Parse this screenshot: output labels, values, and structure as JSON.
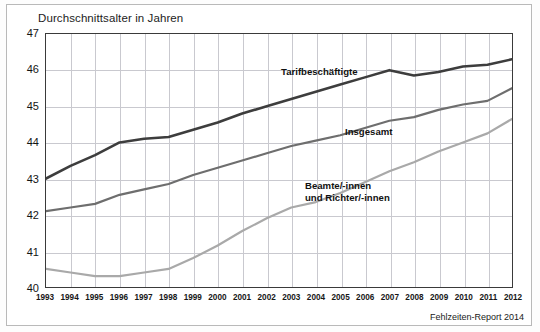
{
  "chart_data": {
    "type": "line",
    "title": "Durchschnittsalter in Jahren",
    "xlabel": "",
    "ylabel": "Durchschnittsalter in Jahren",
    "ylim": [
      40,
      47
    ],
    "yticks": [
      40,
      41,
      42,
      43,
      44,
      45,
      46,
      47
    ],
    "grid": true,
    "legend_position": "inline-annotations",
    "source": "Fehlzeiten-Report 2014",
    "categories": [
      "1993",
      "1994",
      "1995",
      "1996",
      "1997",
      "1998",
      "1999",
      "2000",
      "2001",
      "2002",
      "2003",
      "2004",
      "2005",
      "2006",
      "2007",
      "2008",
      "2009",
      "2010",
      "2011",
      "2012"
    ],
    "series": [
      {
        "name": "Tarifbeschäftigte",
        "color": "#3d3d3d",
        "values": [
          43.0,
          43.35,
          43.65,
          44.0,
          44.1,
          44.15,
          44.35,
          44.55,
          44.8,
          45.0,
          45.2,
          45.4,
          45.6,
          45.8,
          46.0,
          45.85,
          45.95,
          46.1,
          46.15,
          46.3
        ]
      },
      {
        "name": "Insgesamt",
        "color": "#6e6e6e",
        "values": [
          42.1,
          42.2,
          42.3,
          42.55,
          42.7,
          42.85,
          43.1,
          43.3,
          43.5,
          43.7,
          43.9,
          44.05,
          44.2,
          44.4,
          44.6,
          44.7,
          44.9,
          45.05,
          45.15,
          45.5
        ]
      },
      {
        "name": "Beamte/-innen und Richter/-innen",
        "color": "#a9a9a9",
        "values": [
          40.5,
          40.4,
          40.3,
          40.3,
          40.4,
          40.5,
          40.8,
          41.15,
          41.55,
          41.9,
          42.2,
          42.35,
          42.6,
          42.9,
          43.2,
          43.45,
          43.75,
          44.0,
          44.25,
          44.65
        ]
      }
    ],
    "annotations": [
      {
        "text": "Tarifbeschäftigte",
        "series": "Tarifbeschäftigte"
      },
      {
        "text": "Insgesamt",
        "series": "Insgesamt"
      },
      {
        "text": "Beamte/-innen\nund Richter/-innen",
        "series": "Beamte/-innen und Richter/-innen"
      }
    ]
  },
  "labels": {
    "series_top": "Tarifbeschäftigte",
    "series_mid": "Insgesamt",
    "series_low_line1": "Beamte/-innen",
    "series_low_line2": "und Richter/-innen"
  }
}
